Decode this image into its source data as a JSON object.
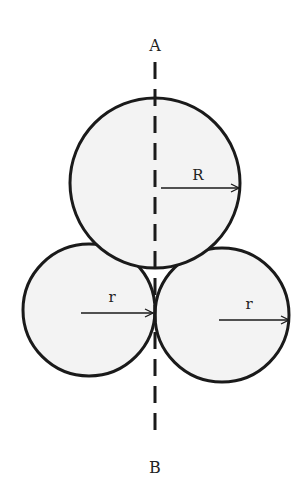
{
  "diagram": {
    "type": "circles-tangent-axis",
    "colors": {
      "background": "#ffffff",
      "circle_fill": "#f3f3f3",
      "stroke": "#1a1a1a"
    },
    "axis": {
      "top_label": "A",
      "bottom_label": "B",
      "style": "dashed",
      "x": 155,
      "y1": 62,
      "y2": 440
    },
    "circles": [
      {
        "id": "large",
        "cx": 155,
        "cy": 183,
        "r": 85,
        "radius_label": "R",
        "arrow": {
          "x1": 161,
          "y1": 188,
          "x2": 239,
          "y2": 188
        },
        "label_pos": {
          "x": 198,
          "y": 180
        }
      },
      {
        "id": "small-left",
        "cx": 89,
        "cy": 310,
        "r": 66,
        "radius_label": "r",
        "arrow": {
          "x1": 81,
          "y1": 313,
          "x2": 153,
          "y2": 313
        },
        "label_pos": {
          "x": 112,
          "y": 302
        }
      },
      {
        "id": "small-right",
        "cx": 222,
        "cy": 315,
        "r": 67,
        "radius_label": "r",
        "arrow": {
          "x1": 219,
          "y1": 320,
          "x2": 289,
          "y2": 320
        },
        "label_pos": {
          "x": 249,
          "y": 309
        }
      }
    ]
  }
}
